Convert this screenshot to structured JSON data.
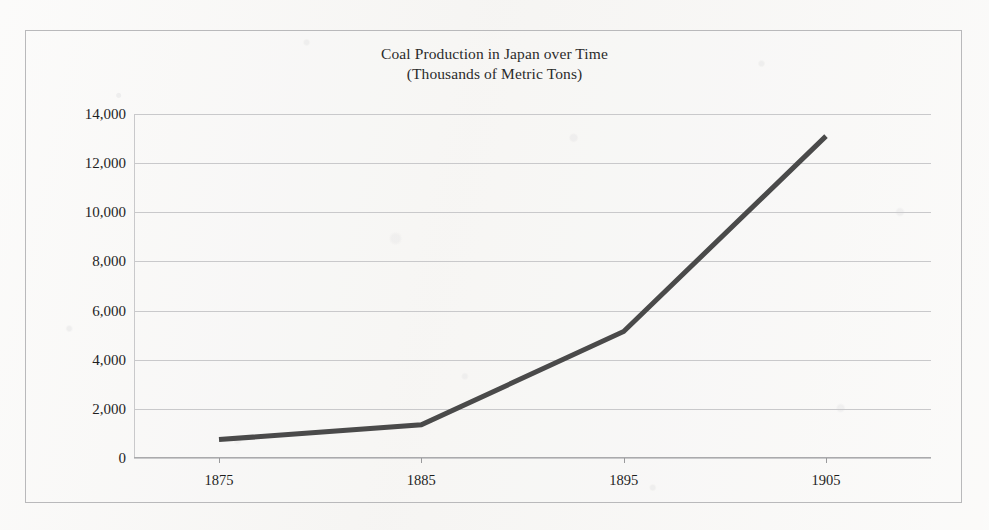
{
  "chart_data": {
    "type": "line",
    "title": "Coal Production in Japan over Time",
    "subtitle": "(Thousands of Metric Tons)",
    "xlabel": "",
    "ylabel": "",
    "x": [
      1875,
      1885,
      1895,
      1905
    ],
    "categories": [
      "1875",
      "1885",
      "1895",
      "1905"
    ],
    "values": [
      750,
      1350,
      5150,
      13100
    ],
    "series": [
      {
        "name": "Coal Production",
        "values": [
          750,
          1350,
          5150,
          13100
        ]
      }
    ],
    "xlim": [
      1875,
      1905
    ],
    "ylim": [
      0,
      14000
    ],
    "ytick_values": [
      0,
      2000,
      4000,
      6000,
      8000,
      10000,
      12000,
      14000
    ],
    "ytick_labels": [
      "0",
      "2,000",
      "4,000",
      "6,000",
      "8,000",
      "10,000",
      "12,000",
      "14,000"
    ],
    "xtick_values": [
      1875,
      1885,
      1895,
      1905
    ],
    "xtick_labels": [
      "1875",
      "1885",
      "1895",
      "1905"
    ],
    "grid": "horizontal",
    "legend": "none",
    "line_color": "#4a4a4a",
    "line_width": 5,
    "gridline_color": "#c9c9cb",
    "frame_color": "#b9b9bb",
    "background_color": "#f7f6f4",
    "text_color": "#1f1f1f"
  }
}
